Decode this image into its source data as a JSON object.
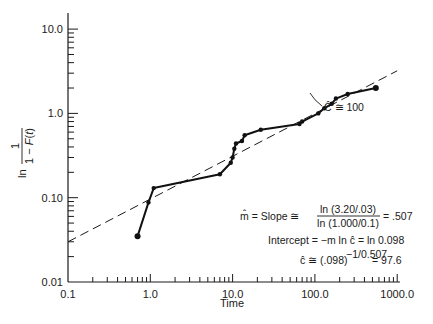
{
  "chart_data": {
    "type": "line",
    "title": "",
    "xlabel": "Time",
    "ylabel": "ln 1/(1 − F(t))",
    "xscale": "log",
    "yscale": "log",
    "xlim": [
      0.1,
      1000.0
    ],
    "ylim": [
      0.01,
      10.0
    ],
    "x_tick_labels": [
      "0.1",
      "1.0",
      "10.0",
      "100.0",
      "1000.0"
    ],
    "y_tick_labels": [
      "0.01",
      "0.10",
      "1.0",
      "10.0"
    ],
    "grid": false,
    "legend": null,
    "series": [
      {
        "name": "Observed data",
        "style": "solid-with-markers",
        "x": [
          0.7,
          0.95,
          1.1,
          7.0,
          9.5,
          10.0,
          10.5,
          11.0,
          13.0,
          14.0,
          22.0,
          65.0,
          70.0,
          110.0,
          130.0,
          160.0,
          180.0,
          250.0,
          550.0
        ],
        "y": [
          0.035,
          0.088,
          0.13,
          0.19,
          0.26,
          0.3,
          0.38,
          0.44,
          0.47,
          0.55,
          0.64,
          0.75,
          0.8,
          1.0,
          1.15,
          1.3,
          1.5,
          1.7,
          2.0
        ]
      },
      {
        "name": "Fitted Weibull line",
        "style": "dashed",
        "x": [
          0.1,
          1000.0
        ],
        "y": [
          0.03,
          3.2
        ]
      }
    ],
    "annotations": {
      "c_marker": "Ĉ ≅ 100",
      "slope_line_lhs": "m̂ = Slope ≅",
      "slope_numerator": "ln (3.20/.03)",
      "slope_denominator": "ln (1.000/0.1)",
      "slope_value": "= .507",
      "intercept_line": "Intercept = −m ln ĉ = ln 0.098",
      "c_estimate_base": "ĉ ≅ (.098)",
      "c_estimate_exp": "−1/0.507",
      "c_estimate_value": "= 97.6"
    }
  }
}
